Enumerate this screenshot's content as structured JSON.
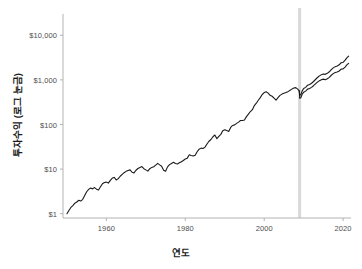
{
  "chart_data": {
    "type": "line",
    "title": "",
    "xlabel": "연도",
    "ylabel": "투자수익 (로그 눈금)",
    "yscale": "log",
    "xlim": [
      1949,
      2022
    ],
    "ylim": [
      0.8,
      30000
    ],
    "grid": false,
    "legend": "none",
    "xticks": [
      1960,
      1980,
      2000,
      2020
    ],
    "xticklabels": [
      "1960",
      "1980",
      "2000",
      "2020"
    ],
    "yticks": [
      1,
      10,
      100,
      1000,
      10000
    ],
    "yticklabels": [
      "$1",
      "$10",
      "$100",
      "$1,000",
      "$10,000"
    ],
    "annotations": [
      {
        "type": "vspan",
        "name": "crisis-band",
        "x_start": 2008.6,
        "x_end": 2009.3,
        "color": "#d9d9d9",
        "label": ""
      }
    ],
    "series": [
      {
        "name": "main",
        "color": "#1a1a1a",
        "x": [
          1950.0,
          1950.5,
          1951.0,
          1951.5,
          1952.0,
          1952.5,
          1953.0,
          1953.5,
          1954.0,
          1954.5,
          1955.0,
          1955.5,
          1956.0,
          1956.5,
          1957.0,
          1957.5,
          1958.0,
          1958.5,
          1959.0,
          1959.5,
          1960.0,
          1960.5,
          1961.0,
          1961.5,
          1962.0,
          1962.5,
          1963.0,
          1963.5,
          1964.0,
          1964.5,
          1965.0,
          1965.5,
          1966.0,
          1966.5,
          1967.0,
          1967.5,
          1968.0,
          1968.5,
          1969.0,
          1969.5,
          1970.0,
          1970.5,
          1971.0,
          1971.5,
          1972.0,
          1972.5,
          1973.0,
          1973.5,
          1974.0,
          1974.5,
          1975.0,
          1975.5,
          1976.0,
          1976.5,
          1977.0,
          1977.5,
          1978.0,
          1978.5,
          1979.0,
          1979.5,
          1980.0,
          1980.5,
          1981.0,
          1981.5,
          1982.0,
          1982.5,
          1983.0,
          1983.5,
          1984.0,
          1984.5,
          1985.0,
          1985.5,
          1986.0,
          1986.5,
          1987.0,
          1987.5,
          1988.0,
          1988.5,
          1989.0,
          1989.5,
          1990.0,
          1990.5,
          1991.0,
          1991.5,
          1992.0,
          1992.5,
          1993.0,
          1993.5,
          1994.0,
          1994.5,
          1995.0,
          1995.5,
          1996.0,
          1996.5,
          1997.0,
          1997.5,
          1998.0,
          1998.5,
          1999.0,
          1999.5,
          2000.0,
          2000.5,
          2001.0,
          2001.5,
          2002.0,
          2002.5,
          2003.0,
          2003.5,
          2004.0,
          2004.5,
          2005.0,
          2005.5,
          2006.0,
          2006.5,
          2007.0,
          2007.5,
          2008.0,
          2008.5,
          2008.9
        ],
        "y": [
          1.0,
          1.18,
          1.38,
          1.52,
          1.72,
          1.83,
          2.0,
          1.92,
          2.1,
          2.55,
          3.1,
          3.5,
          3.75,
          3.6,
          3.85,
          3.55,
          3.4,
          4.0,
          4.7,
          5.0,
          5.1,
          4.85,
          5.6,
          6.3,
          6.5,
          5.7,
          6.1,
          6.9,
          7.6,
          8.3,
          8.9,
          9.3,
          9.6,
          8.5,
          8.2,
          9.4,
          10.3,
          10.9,
          11.4,
          10.2,
          9.6,
          9.0,
          10.2,
          10.9,
          11.3,
          12.3,
          13.4,
          12.4,
          11.6,
          9.4,
          8.9,
          11.2,
          12.6,
          13.4,
          14.2,
          13.4,
          13.0,
          13.8,
          14.6,
          15.6,
          16.8,
          17.6,
          21.0,
          20.2,
          19.6,
          20.5,
          24.5,
          28.0,
          29.5,
          29.0,
          31.0,
          36.5,
          42.0,
          46.0,
          53.0,
          58.0,
          48.0,
          54.0,
          60.0,
          72.0,
          76.0,
          73.0,
          70.0,
          86.0,
          95.0,
          98.0,
          106.0,
          113.0,
          123.0,
          123.0,
          126.0,
          150.0,
          170.0,
          195.0,
          215.0,
          265.0,
          300.0,
          350.0,
          400.0,
          470.0,
          520.0,
          540.0,
          505.0,
          450.0,
          430.0,
          390.0,
          350.0,
          400.0,
          450.0,
          480.0,
          500.0,
          520.0,
          545.0,
          580.0,
          620.0,
          660.0,
          670.0,
          620.0,
          560.0
        ]
      },
      {
        "name": "branch-upper",
        "color": "#1a1a1a",
        "x": [
          2008.9,
          2009.0,
          2009.3,
          2009.6,
          2010.0,
          2010.5,
          2011.0,
          2011.5,
          2012.0,
          2012.5,
          2013.0,
          2013.5,
          2014.0,
          2014.5,
          2015.0,
          2015.5,
          2016.0,
          2016.5,
          2017.0,
          2017.5,
          2018.0,
          2018.5,
          2019.0,
          2019.5,
          2020.0,
          2020.5,
          2021.0,
          2021.4
        ],
        "y": [
          560.0,
          450.0,
          470.0,
          560.0,
          640.0,
          680.0,
          760.0,
          790.0,
          840.0,
          920.0,
          1020.0,
          1130.0,
          1230.0,
          1310.0,
          1360.0,
          1330.0,
          1400.0,
          1520.0,
          1700.0,
          1860.0,
          1980.0,
          2050.0,
          2180.0,
          2420.0,
          2480.0,
          2760.0,
          3150.0,
          3400.0
        ]
      },
      {
        "name": "branch-lower",
        "color": "#1a1a1a",
        "x": [
          2008.9,
          2009.0,
          2009.3,
          2009.6,
          2010.0,
          2010.5,
          2011.0,
          2011.5,
          2012.0,
          2012.5,
          2013.0,
          2013.5,
          2014.0,
          2014.5,
          2015.0,
          2015.5,
          2016.0,
          2016.5,
          2017.0,
          2017.5,
          2018.0,
          2018.5,
          2019.0,
          2019.5,
          2020.0,
          2020.5,
          2021.0,
          2021.4
        ],
        "y": [
          560.0,
          390.0,
          400.0,
          470.0,
          530.0,
          560.0,
          620.0,
          640.0,
          680.0,
          740.0,
          810.0,
          890.0,
          960.0,
          1010.0,
          1040.0,
          1010.0,
          1060.0,
          1140.0,
          1270.0,
          1380.0,
          1460.0,
          1500.0,
          1580.0,
          1740.0,
          1760.0,
          1940.0,
          2200.0,
          2350.0
        ]
      }
    ]
  },
  "axes": {
    "spine_color": "#b3b3b3",
    "tick_color": "#4d4d4d"
  }
}
